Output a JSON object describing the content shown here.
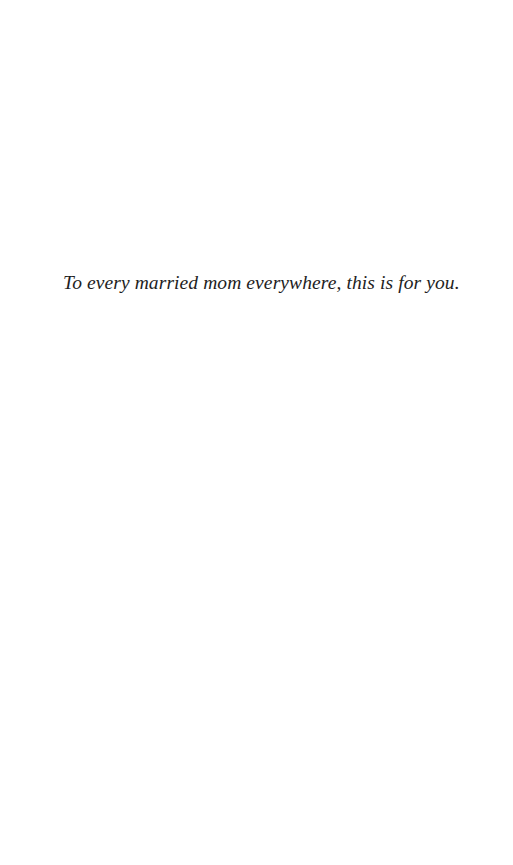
{
  "page": {
    "type": "dedication",
    "dedication_text": "To every married mom everywhere, this is for you.",
    "colors": {
      "background": "#ffffff",
      "text": "#1e1e1e"
    }
  }
}
